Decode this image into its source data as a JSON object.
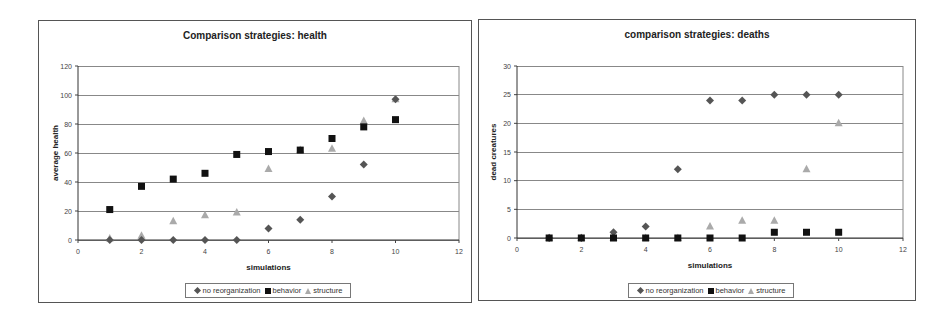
{
  "chart_data": [
    {
      "type": "scatter",
      "title": "Comparison strategies: health",
      "xlabel": "simulations",
      "ylabel": "average health",
      "xlim": [
        0,
        12
      ],
      "ylim": [
        0,
        120
      ],
      "xticks": [
        0,
        2,
        4,
        6,
        8,
        10,
        12
      ],
      "yticks": [
        0,
        20,
        40,
        60,
        80,
        100,
        120
      ],
      "grid": "horizontal",
      "legend_position": "bottom",
      "x": [
        1,
        2,
        3,
        4,
        5,
        6,
        7,
        8,
        9,
        10
      ],
      "series": [
        {
          "name": "no reorganization",
          "marker": "diamond",
          "color": "#555555",
          "values": [
            0,
            0,
            0,
            0,
            0,
            8,
            14,
            30,
            52,
            97
          ]
        },
        {
          "name": "behavior",
          "marker": "square",
          "color": "#111111",
          "values": [
            21,
            37,
            42,
            46,
            59,
            61,
            62,
            70,
            78,
            83
          ]
        },
        {
          "name": "structure",
          "marker": "triangle",
          "color": "#aaaaaa",
          "values": [
            1,
            3,
            13,
            17,
            19,
            49,
            62,
            63,
            82,
            97
          ]
        }
      ]
    },
    {
      "type": "scatter",
      "title": "comparison strategies: deaths",
      "xlabel": "simulations",
      "ylabel": "dead creatures",
      "xlim": [
        0,
        12
      ],
      "ylim": [
        0,
        30
      ],
      "xticks": [
        0,
        2,
        4,
        6,
        8,
        10,
        12
      ],
      "yticks": [
        0,
        5,
        10,
        15,
        20,
        25,
        30
      ],
      "grid": "horizontal",
      "legend_position": "bottom",
      "x": [
        1,
        2,
        3,
        4,
        5,
        6,
        7,
        8,
        9,
        10
      ],
      "series": [
        {
          "name": "no reorganization",
          "marker": "diamond",
          "color": "#555555",
          "values": [
            0,
            0,
            1,
            2,
            12,
            24,
            24,
            25,
            25,
            25
          ]
        },
        {
          "name": "behavior",
          "marker": "square",
          "color": "#111111",
          "values": [
            0,
            0,
            0,
            0,
            0,
            0,
            0,
            1,
            1,
            1
          ]
        },
        {
          "name": "structure",
          "marker": "triangle",
          "color": "#aaaaaa",
          "values": [
            0,
            0,
            0,
            0,
            0,
            2,
            3,
            3,
            12,
            20
          ]
        }
      ]
    }
  ],
  "charts": [
    {
      "title": "Comparison strategies: health",
      "xlabel": "simulations",
      "ylabel": "average health",
      "legend": [
        "no reorganization",
        "behavior",
        "structure"
      ]
    },
    {
      "title": "comparison strategies: deaths",
      "xlabel": "simulations",
      "ylabel": "dead creatures",
      "legend": [
        "no reorganization",
        "behavior",
        "structure"
      ]
    }
  ],
  "colors": {
    "no_reorganization": "#555555",
    "behavior": "#111111",
    "structure": "#aaaaaa",
    "gridline": "#888888",
    "frame": "#555555"
  }
}
